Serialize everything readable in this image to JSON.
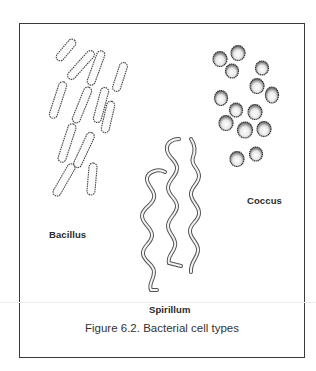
{
  "figure": {
    "caption": "Figure 6.2. Bacterial cell types",
    "labels": {
      "bacillus": "Bacillus",
      "coccus": "Coccus",
      "spirillum": "Spirillum"
    },
    "groups": [
      {
        "name": "Bacillus",
        "shape": "rod",
        "count": 13
      },
      {
        "name": "Coccus",
        "shape": "sphere",
        "count": 15
      },
      {
        "name": "Spirillum",
        "shape": "spiral",
        "count": 3
      }
    ],
    "colors": {
      "stroke": "#3a3a3a",
      "background": "#ffffff"
    }
  }
}
